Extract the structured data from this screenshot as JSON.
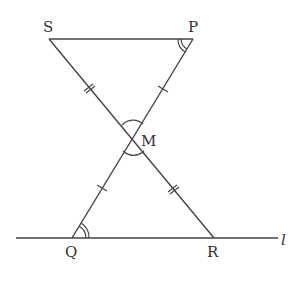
{
  "diagram": {
    "type": "geometry",
    "points": {
      "S": {
        "label": "S",
        "x": 49,
        "y": 39
      },
      "P": {
        "label": "P",
        "x": 193,
        "y": 39
      },
      "M": {
        "label": "M",
        "x": 133,
        "y": 138
      },
      "Q": {
        "label": "Q",
        "x": 72,
        "y": 238
      },
      "R": {
        "label": "R",
        "x": 214,
        "y": 238
      }
    },
    "line_label": "l",
    "segments": [
      "SP",
      "SR",
      "PQ",
      "line l through Q and R"
    ],
    "equal_marks": {
      "single_tick": [
        "PM",
        "QM"
      ],
      "double_tick": [
        "SM",
        "MR"
      ]
    },
    "angle_marks": {
      "double_arc": [
        "angle SPM",
        "angle MQR"
      ],
      "single_arc": [
        "angle SMP",
        "angle QMR"
      ]
    }
  }
}
